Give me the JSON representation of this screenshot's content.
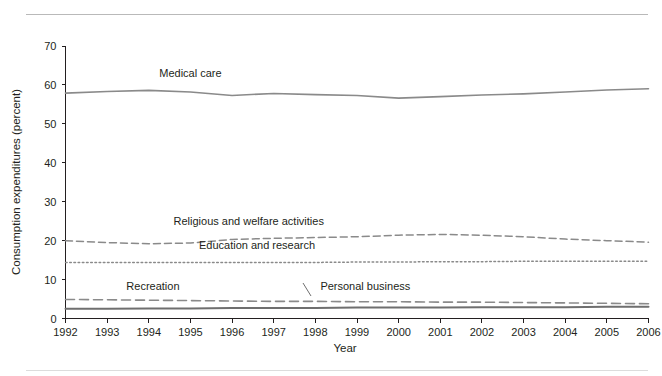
{
  "chart_data": {
    "type": "line",
    "title": "",
    "xlabel": "Year",
    "ylabel": "Consumption expenditures (percent)",
    "xlim": [
      1992,
      2006
    ],
    "ylim": [
      0,
      70
    ],
    "ytick_step": 10,
    "grid": false,
    "legend_position": "inline-labels",
    "x": [
      1992,
      1993,
      1994,
      1995,
      1996,
      1997,
      1998,
      1999,
      2000,
      2001,
      2002,
      2003,
      2004,
      2005,
      2006
    ],
    "xticklabels": [
      "1992",
      "1993",
      "1994",
      "1995",
      "1996",
      "1997",
      "1998",
      "1999",
      "2000",
      "2001",
      "2002",
      "2003",
      "2004",
      "2005",
      "2006"
    ],
    "yticklabels": [
      "0",
      "10",
      "20",
      "30",
      "40",
      "50",
      "60",
      "70"
    ],
    "series": [
      {
        "name": "Medical care",
        "style": "solid",
        "color": "#8a8a8a",
        "values": [
          57.9,
          58.3,
          58.6,
          58.2,
          57.3,
          57.8,
          57.5,
          57.3,
          56.6,
          57.0,
          57.4,
          57.7,
          58.2,
          58.7,
          59.0
        ]
      },
      {
        "name": "Religious and welfare activities",
        "style": "dashed",
        "color": "#8a8a8a",
        "values": [
          20.0,
          19.5,
          19.2,
          19.4,
          20.3,
          20.6,
          20.8,
          21.0,
          21.4,
          21.6,
          21.4,
          21.0,
          20.4,
          20.0,
          19.6
        ]
      },
      {
        "name": "Education and research",
        "style": "dotted",
        "color": "#8a8a8a",
        "values": [
          14.4,
          14.4,
          14.4,
          14.4,
          14.4,
          14.4,
          14.4,
          14.5,
          14.5,
          14.6,
          14.6,
          14.7,
          14.7,
          14.7,
          14.7
        ]
      },
      {
        "name": "Recreation",
        "style": "longdash",
        "color": "#8a8a8a",
        "values": [
          4.9,
          4.8,
          4.7,
          4.6,
          4.5,
          4.4,
          4.4,
          4.3,
          4.3,
          4.2,
          4.2,
          4.1,
          4.0,
          3.9,
          3.8
        ]
      },
      {
        "name": "Personal business",
        "style": "solid-dark",
        "color": "#6f6f6f",
        "values": [
          2.5,
          2.5,
          2.6,
          2.6,
          2.7,
          2.7,
          2.7,
          2.8,
          2.8,
          2.8,
          2.9,
          2.9,
          2.9,
          3.0,
          3.0
        ]
      }
    ],
    "annotations": [
      {
        "text": "Medical care",
        "x": 1995.0,
        "y": 62.0
      },
      {
        "text": "Religious and welfare activities",
        "x": 1996.4,
        "y": 24.0
      },
      {
        "text": "Education and research",
        "x": 1996.6,
        "y": 17.8
      },
      {
        "text": "Recreation",
        "x": 1994.1,
        "y": 7.4
      },
      {
        "text": "Personal business",
        "x": 1999.2,
        "y": 7.4
      }
    ]
  },
  "axis": {
    "y_title": "Consumption expenditures (percent)",
    "x_title": "Year"
  },
  "labels": {
    "medical_care": "Medical care",
    "religious": "Religious and welfare activities",
    "education": "Education and research",
    "recreation": "Recreation",
    "personal_business": "Personal business"
  },
  "yticks": [
    "70",
    "60",
    "50",
    "40",
    "30",
    "20",
    "10",
    "0"
  ],
  "xticks": [
    "1992",
    "1993",
    "1994",
    "1995",
    "1996",
    "1997",
    "1998",
    "1999",
    "2000",
    "2001",
    "2002",
    "2003",
    "2004",
    "2005",
    "2006"
  ]
}
